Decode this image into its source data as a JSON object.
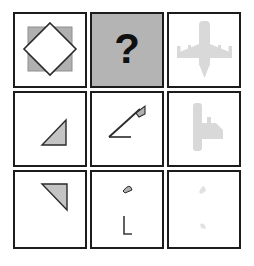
{
  "puzzle": {
    "title": "Matrix Reasoning Puzzle",
    "type": "3x3-visual-analogy-matrix",
    "rows": 3,
    "columns": 3,
    "missing_cell_index": 1,
    "missing_cell_label": "?",
    "colors": {
      "background": "#ffffff",
      "cell_border": "#1c1c1c",
      "cell_fill": "#ffffff",
      "shaded_cell_fill": "#b4b4b4",
      "shape_gray": "#b0b0b0",
      "shape_outline": "#2a2a2a",
      "shape_light_gray": "#d9d9d9",
      "shape_faint_gray": "#e6e6e6",
      "question_mark_color": "#101010"
    },
    "cells": [
      {
        "index": 0,
        "position": "row1-col1",
        "shaded": false,
        "description": "gray square with inscribed white diamond outlined in dark",
        "shapes": [
          "gray-square",
          "white-diamond-outline"
        ]
      },
      {
        "index": 1,
        "position": "row1-col2",
        "shaded": true,
        "description": "solid gray cell with bold black question mark",
        "label": "?",
        "shapes": [
          "question-mark"
        ]
      },
      {
        "index": 2,
        "position": "row1-col3",
        "shaded": false,
        "description": "light gray airplane silhouette, top view, pointing down",
        "shapes": [
          "airplane-silhouette"
        ]
      },
      {
        "index": 3,
        "position": "row2-col1",
        "shaded": false,
        "description": "small gray right triangle, right angle bottom-right",
        "shapes": [
          "right-triangle-up"
        ]
      },
      {
        "index": 4,
        "position": "row2-col2",
        "shaded": false,
        "description": "diagonal line with small gray flag at upper end and short horizontal foot at lower left",
        "shapes": [
          "diagonal-line",
          "gray-flag",
          "horizontal-foot"
        ]
      },
      {
        "index": 5,
        "position": "row2-col3",
        "shaded": false,
        "description": "light gray partial airplane rotated, vertical bar with mass to the right",
        "shapes": [
          "airplane-fragment-rotated"
        ]
      },
      {
        "index": 6,
        "position": "row3-col1",
        "shaded": false,
        "description": "gray right triangle, right angle top-right, hypotenuse down-left",
        "shapes": [
          "right-triangle-down"
        ]
      },
      {
        "index": 7,
        "position": "row3-col2",
        "shaded": false,
        "description": "small gray curved wedge at top center and thin L-shaped line below",
        "shapes": [
          "gray-wedge",
          "l-shaped-line"
        ]
      },
      {
        "index": 8,
        "position": "row3-col3",
        "shaded": false,
        "description": "two very faint light gray fragments, one upper center one lower center",
        "shapes": [
          "faint-wedge-top",
          "faint-wedge-bottom"
        ]
      }
    ]
  }
}
